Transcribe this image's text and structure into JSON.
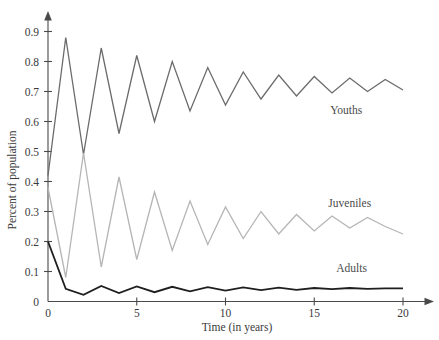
{
  "chart_data": {
    "type": "line",
    "title": "",
    "xlabel": "Time (in years)",
    "ylabel": "Percent of population",
    "xlim": [
      0,
      20
    ],
    "ylim": [
      0,
      0.95
    ],
    "grid": false,
    "legend_position": "inline-right",
    "x": [
      0,
      1,
      2,
      3,
      4,
      5,
      6,
      7,
      8,
      9,
      10,
      11,
      12,
      13,
      14,
      15,
      16,
      17,
      18,
      19,
      20
    ],
    "xticks": [
      0,
      5,
      10,
      15,
      20
    ],
    "xtick_labels": [
      "0",
      "5",
      "10",
      "15",
      "20"
    ],
    "yticks": [
      0,
      0.1,
      0.2,
      0.3,
      0.4,
      0.5,
      0.6,
      0.7,
      0.8,
      0.9
    ],
    "ytick_labels": [
      "0",
      "0.1",
      "0.2",
      "0.3",
      "0.4",
      "0.5",
      "0.6",
      "0.7",
      "0.8",
      "0.9"
    ],
    "series": [
      {
        "name": "Youths",
        "color": "#6b6b6b",
        "line_width": 1.3,
        "label_x": 16.8,
        "label_y": 0.625,
        "values": [
          0.42,
          0.88,
          0.49,
          0.845,
          0.56,
          0.82,
          0.6,
          0.8,
          0.635,
          0.78,
          0.655,
          0.765,
          0.675,
          0.755,
          0.685,
          0.75,
          0.695,
          0.745,
          0.7,
          0.74,
          0.705
        ]
      },
      {
        "name": "Juveniles",
        "color": "#b5b5b5",
        "line_width": 1.3,
        "label_x": 17.0,
        "label_y": 0.315,
        "values": [
          0.38,
          0.08,
          0.495,
          0.115,
          0.415,
          0.14,
          0.365,
          0.17,
          0.335,
          0.19,
          0.315,
          0.21,
          0.3,
          0.225,
          0.29,
          0.235,
          0.285,
          0.245,
          0.28,
          0.25,
          0.225
        ]
      },
      {
        "name": "Adults",
        "color": "#1f1f1f",
        "line_width": 1.8,
        "label_x": 17.1,
        "label_y": 0.098,
        "values": [
          0.2,
          0.042,
          0.022,
          0.052,
          0.028,
          0.05,
          0.031,
          0.049,
          0.034,
          0.048,
          0.036,
          0.047,
          0.038,
          0.046,
          0.039,
          0.045,
          0.041,
          0.045,
          0.042,
          0.044,
          0.044
        ]
      }
    ]
  },
  "axes": {
    "x_axis_name": "x-axis",
    "y_axis_name": "y-axis"
  }
}
